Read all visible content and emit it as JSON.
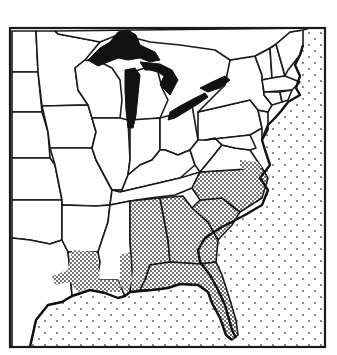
{
  "map": {
    "title": "",
    "region": "Eastern United States",
    "frame": {
      "x": 10,
      "y": 28,
      "width": 315,
      "height": 319
    },
    "colors": {
      "border": "#1a1a1a",
      "land": "#ffffff",
      "lakes": "#111111",
      "coastal_stipple": "#333333",
      "ocean_dots": "#555555"
    },
    "legend": [],
    "features": [
      {
        "name": "great-lakes",
        "fill": "solid-black"
      },
      {
        "name": "coastal-plain",
        "fill": "dense-stipple"
      },
      {
        "name": "ocean",
        "fill": "sparse-dots"
      }
    ]
  }
}
